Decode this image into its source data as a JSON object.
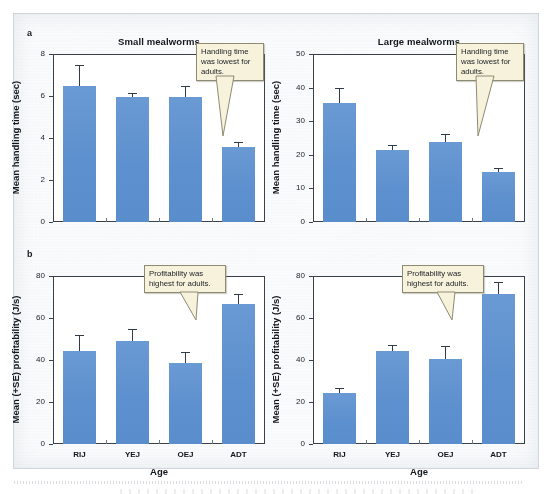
{
  "figure": {
    "panel_a_letter": "a",
    "panel_b_letter": "b"
  },
  "chart_data": [
    {
      "id": "a-small",
      "type": "bar",
      "title": "Small mealworms",
      "xlabel": "",
      "ylabel": "Mean handling time (sec)",
      "categories": [
        "RIJ",
        "YEJ",
        "OEJ",
        "ADT"
      ],
      "show_xticklabels": false,
      "values": [
        6.5,
        5.95,
        5.95,
        3.55
      ],
      "errors_upper": [
        7.5,
        6.15,
        6.5,
        3.8
      ],
      "ylim": [
        0,
        8
      ],
      "yticks": [
        0,
        2,
        4,
        6,
        8
      ],
      "ytick_labels": [
        "0",
        "2",
        "4",
        "6",
        "8"
      ],
      "grid": false,
      "legend": "none",
      "annotation": "Handling time was lowest for adults.",
      "annotation_target": "ADT"
    },
    {
      "id": "a-large",
      "type": "bar",
      "title": "Large mealworms",
      "xlabel": "",
      "ylabel": "Mean handling time (sec)",
      "categories": [
        "RIJ",
        "YEJ",
        "OEJ",
        "ADT"
      ],
      "show_xticklabels": false,
      "values": [
        35.5,
        21.5,
        23.8,
        14.8
      ],
      "errors_upper": [
        39.8,
        23.0,
        26.3,
        16.2
      ],
      "ylim": [
        0,
        50
      ],
      "yticks": [
        0,
        10,
        20,
        30,
        40,
        50
      ],
      "ytick_labels": [
        "0",
        "10",
        "20",
        "30",
        "40",
        "50"
      ],
      "grid": false,
      "legend": "none",
      "annotation": "Handling time was lowest for adults.",
      "annotation_target": "ADT"
    },
    {
      "id": "b-small",
      "type": "bar",
      "title": "",
      "xlabel": "Age",
      "ylabel": "Mean (+SE) profitability (J/s)",
      "categories": [
        "RIJ",
        "YEJ",
        "OEJ",
        "ADT"
      ],
      "show_xticklabels": true,
      "values": [
        44.5,
        49.0,
        38.5,
        66.5
      ],
      "errors_upper": [
        52.0,
        55.0,
        44.0,
        71.5
      ],
      "ylim": [
        0,
        80
      ],
      "yticks": [
        0,
        20,
        40,
        60,
        80
      ],
      "ytick_labels": [
        "0",
        "20",
        "40",
        "60",
        "80"
      ],
      "grid": false,
      "legend": "none",
      "annotation": "Profitability was highest for adults.",
      "annotation_target": "ADT"
    },
    {
      "id": "b-large",
      "type": "bar",
      "title": "",
      "xlabel": "Age",
      "ylabel": "Mean (+SE) profitability (J/s)",
      "categories": [
        "RIJ",
        "YEJ",
        "OEJ",
        "ADT"
      ],
      "show_xticklabels": true,
      "values": [
        24.5,
        44.5,
        40.5,
        71.5
      ],
      "errors_upper": [
        26.5,
        47.0,
        46.5,
        77.0
      ],
      "ylim": [
        0,
        80
      ],
      "yticks": [
        0,
        20,
        40,
        60,
        80
      ],
      "ytick_labels": [
        "0",
        "20",
        "40",
        "60",
        "80"
      ],
      "grid": false,
      "legend": "none",
      "annotation": "Profitability was highest for adults.",
      "annotation_target": "ADT"
    }
  ],
  "colors": {
    "bar": "#5e92cf",
    "axis": "#3a4148",
    "callout_bg": "#f6f2dc",
    "callout_border": "#8e8a72",
    "page_bg": "#fafbfc"
  }
}
